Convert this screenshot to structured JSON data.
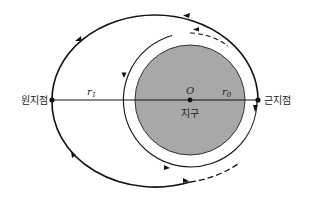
{
  "diagram": {
    "type": "orbital-transfer",
    "labels": {
      "apogee": "원지점",
      "perigee": "근지점",
      "earth": "지구",
      "center": "O",
      "r1_base": "r",
      "r1_sub": "1",
      "r0_base": "r",
      "r0_sub": "0"
    },
    "colors": {
      "earth_fill": "#a8a8a8",
      "line": "#111111",
      "background": "#ffffff"
    },
    "elements": {
      "earth": {
        "cx": 190,
        "cy": 100,
        "r": 55
      },
      "circular_orbit": {
        "cx": 190,
        "cy": 100,
        "r": 67
      },
      "elliptical_orbit": {
        "cx": 155,
        "cy": 100,
        "rx": 103,
        "ry": 85
      },
      "apogee_point": {
        "x": 52,
        "y": 100
      },
      "perigee_point": {
        "x": 258,
        "y": 100
      }
    }
  }
}
